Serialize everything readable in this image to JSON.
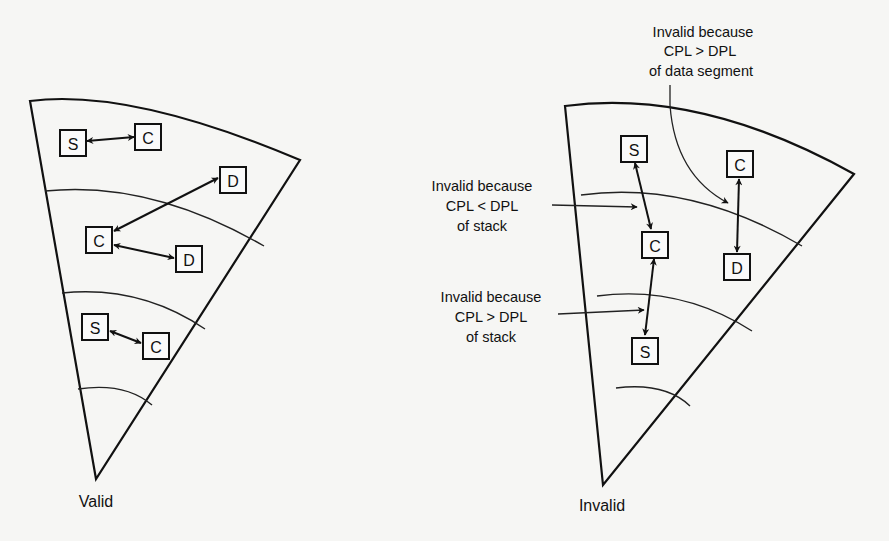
{
  "figure": {
    "left": {
      "caption": "Valid",
      "boxes": [
        {
          "label": "S"
        },
        {
          "label": "C"
        },
        {
          "label": "D"
        },
        {
          "label": "C"
        },
        {
          "label": "D"
        },
        {
          "label": "S"
        },
        {
          "label": "C"
        }
      ]
    },
    "right": {
      "caption": "Invalid",
      "boxes": [
        {
          "label": "S"
        },
        {
          "label": "C"
        },
        {
          "label": "C"
        },
        {
          "label": "D"
        },
        {
          "label": "S"
        }
      ],
      "annotations": {
        "data_segment": {
          "line1": "Invalid because",
          "line2": "CPL > DPL",
          "line3": "of data segment"
        },
        "stack_lt": {
          "line1": "Invalid because",
          "line2": "CPL < DPL",
          "line3": "of stack"
        },
        "stack_gt": {
          "line1": "Invalid because",
          "line2": "CPL > DPL",
          "line3": "of stack"
        }
      }
    }
  },
  "colors": {
    "ink": "#111111",
    "paper": "#f6f6f4"
  }
}
